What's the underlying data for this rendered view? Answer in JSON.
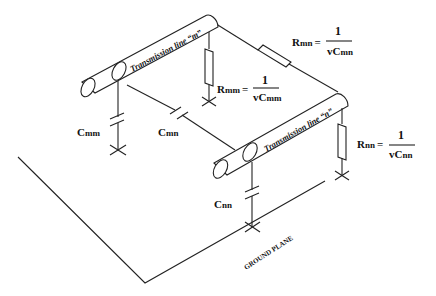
{
  "figure": {
    "type": "diagram",
    "colors": {
      "line": "#222222",
      "background": "#ffffff"
    }
  },
  "transmission_lines": [
    {
      "id": "m",
      "label": "Transmission line “m”"
    },
    {
      "id": "n",
      "label": "Transmission line “n”"
    }
  ],
  "capacitors": {
    "cmm": {
      "label": "C",
      "sub": "mm"
    },
    "cmn": {
      "label": "C",
      "sub": "mn"
    },
    "cnn": {
      "label": "C",
      "sub": "nn"
    }
  },
  "resistors": {
    "rmn": {
      "label": "R",
      "sub": "mn",
      "eq": "=",
      "num": "1",
      "den_v": "vC",
      "den_sub": "mn"
    },
    "rmm": {
      "label": "R",
      "sub": "mm",
      "eq": "=",
      "num": "1",
      "den_v": "vC",
      "den_sub": "mm"
    },
    "rnn": {
      "label": "R",
      "sub": "nn",
      "eq": "=",
      "num": "1",
      "den_v": "vC",
      "den_sub": "nn"
    }
  },
  "ground_plane": {
    "label": "GROUND PLANE"
  }
}
